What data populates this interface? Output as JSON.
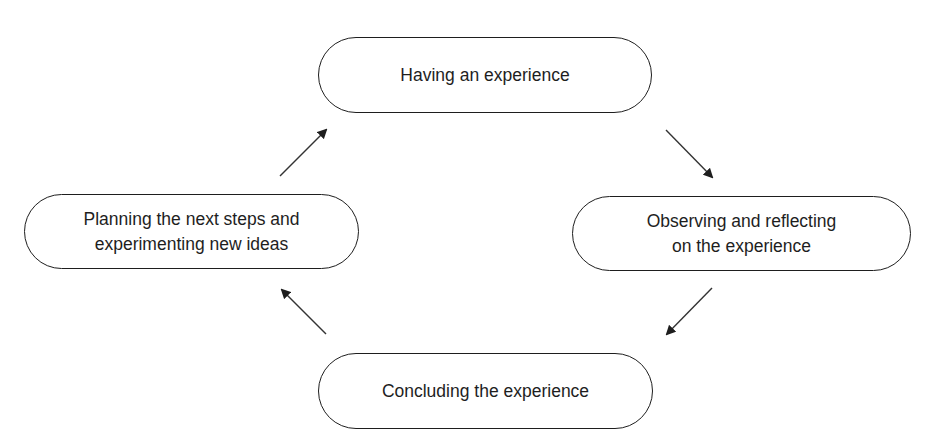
{
  "diagram": {
    "type": "cycle",
    "nodes": [
      {
        "id": "top",
        "label": "Having an experience"
      },
      {
        "id": "right",
        "label": "Observing and reflecting\non the experience"
      },
      {
        "id": "bottom",
        "label": "Concluding the experience"
      },
      {
        "id": "left",
        "label": "Planning the next steps and\nexperimenting new ideas"
      }
    ],
    "edges": [
      {
        "from": "top",
        "to": "right"
      },
      {
        "from": "right",
        "to": "bottom"
      },
      {
        "from": "bottom",
        "to": "left"
      },
      {
        "from": "left",
        "to": "top"
      }
    ],
    "colors": {
      "stroke": "#1e1e1e",
      "background": "#ffffff"
    }
  }
}
